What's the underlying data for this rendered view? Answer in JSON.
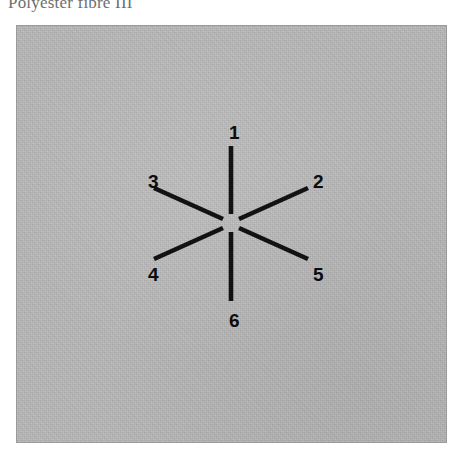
{
  "caption": {
    "text": "Polyester fibre III"
  },
  "figure": {
    "panel": {
      "background_color": "#b8b8b8",
      "border_color": "#9a9a9a"
    },
    "star": {
      "stroke_color": "#121212",
      "center_gap": true,
      "spokes": [
        {
          "id": "1",
          "label": "1",
          "angle_deg": 90,
          "position": "top"
        },
        {
          "id": "2",
          "label": "2",
          "angle_deg": 27,
          "position": "upper-right"
        },
        {
          "id": "3",
          "label": "3",
          "angle_deg": 153,
          "position": "upper-left"
        },
        {
          "id": "4",
          "label": "4",
          "angle_deg": 207,
          "position": "lower-left"
        },
        {
          "id": "5",
          "label": "5",
          "angle_deg": 333,
          "position": "lower-right"
        },
        {
          "id": "6",
          "label": "6",
          "angle_deg": 270,
          "position": "bottom"
        }
      ]
    }
  }
}
